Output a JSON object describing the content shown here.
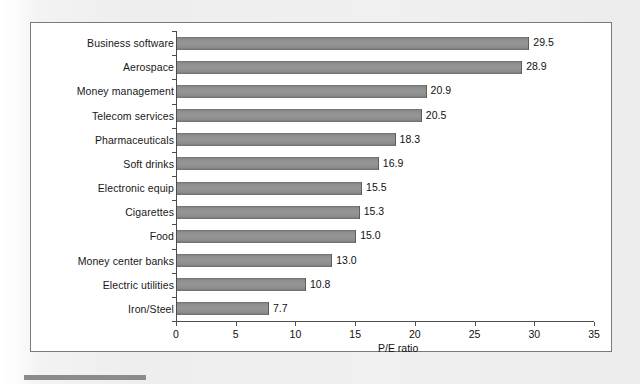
{
  "figure": {
    "background_color": "#f1f1f1",
    "plot_background_color": "#ffffff",
    "border_color": "#7a7a7a",
    "bar_color": "#919191"
  },
  "chart_data": {
    "type": "bar",
    "orientation": "horizontal",
    "title": "",
    "xlabel": "P/E ratio",
    "ylabel": "",
    "xlim": [
      0,
      35
    ],
    "xticks": [
      0,
      5,
      10,
      15,
      20,
      25,
      30,
      35
    ],
    "xtick_labels": [
      "0",
      "5",
      "10",
      "15",
      "20",
      "25",
      "30",
      "35"
    ],
    "grid": false,
    "legend": null,
    "categories": [
      "Business software",
      "Aerospace",
      "Money management",
      "Telecom services",
      "Pharmaceuticals",
      "Soft drinks",
      "Electronic equip",
      "Cigarettes",
      "Food",
      "Money center banks",
      "Electric utilities",
      "Iron/Steel"
    ],
    "values": [
      29.5,
      28.9,
      20.9,
      20.5,
      18.3,
      16.9,
      15.5,
      15.3,
      15.0,
      13.0,
      10.8,
      7.7
    ],
    "value_labels": [
      "29.5",
      "28.9",
      "20.9",
      "20.5",
      "18.3",
      "16.9",
      "15.5",
      "15.3",
      "15.0",
      "13.0",
      "10.8",
      "7.7"
    ]
  }
}
